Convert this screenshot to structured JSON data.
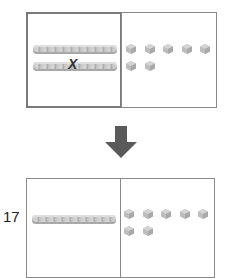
{
  "top_panel": {
    "tens_rods": 2,
    "ones_cubes": 7,
    "crossed_out_rod_index": 1,
    "cross_mark": "X"
  },
  "arrow": {
    "direction": "down",
    "color": "#5a5a5a"
  },
  "bottom_panel": {
    "number_label": "17",
    "tens_rods": 1,
    "ones_cubes": 7
  },
  "colors": {
    "border": "#8a8a8a",
    "block": "#c4c4c4"
  }
}
